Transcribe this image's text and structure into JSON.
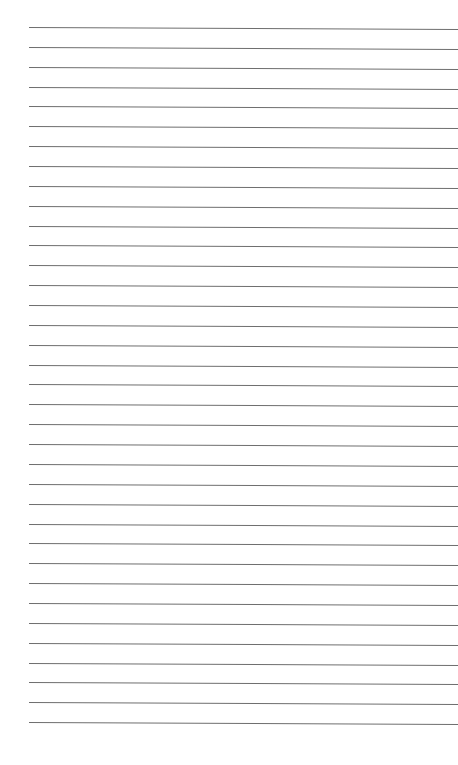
{
  "page": {
    "type": "lined-paper",
    "background": "#ffffff",
    "rule_color": "#6e6e6e",
    "rule_count": 36,
    "first_rule_y": 27,
    "rule_spacing": 19.86,
    "rule_left_x": 29,
    "rule_right_x": 458,
    "rule_slope_px": 2
  }
}
